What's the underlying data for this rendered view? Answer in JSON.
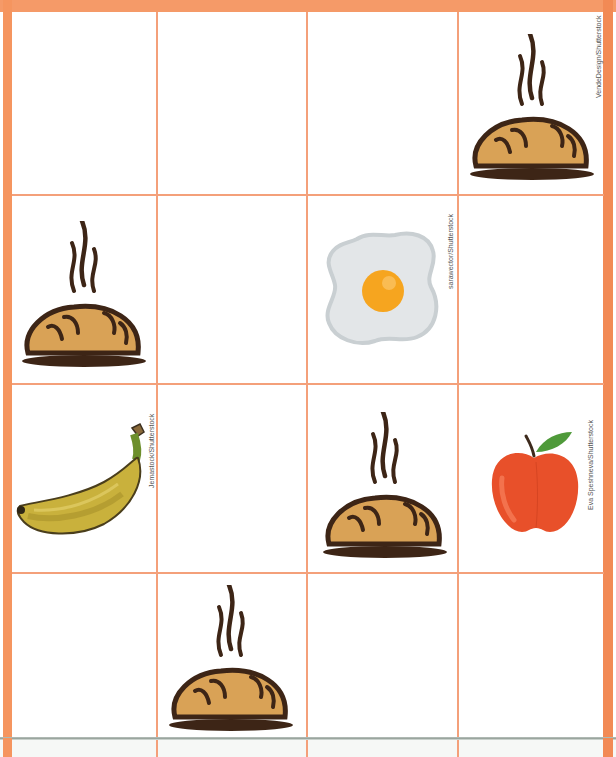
{
  "worksheet": {
    "grid": {
      "rows": 4,
      "cols": 4
    },
    "colors": {
      "border": "#f5955f",
      "grid_line": "#f4a07a",
      "bread_crust": "#d9a256",
      "bread_outline": "#3d2516",
      "egg_white": "#e3e6e8",
      "egg_yolk": "#f6a51f",
      "banana": "#c9b13c",
      "apple": "#e8502a",
      "leaf": "#4f9a3a"
    },
    "cells": [
      {
        "row": 1,
        "col": 1,
        "item": ""
      },
      {
        "row": 1,
        "col": 2,
        "item": ""
      },
      {
        "row": 1,
        "col": 3,
        "item": ""
      },
      {
        "row": 1,
        "col": 4,
        "item": "bread"
      },
      {
        "row": 2,
        "col": 1,
        "item": "bread"
      },
      {
        "row": 2,
        "col": 2,
        "item": ""
      },
      {
        "row": 2,
        "col": 3,
        "item": "fried-egg"
      },
      {
        "row": 2,
        "col": 4,
        "item": ""
      },
      {
        "row": 3,
        "col": 1,
        "item": "banana"
      },
      {
        "row": 3,
        "col": 2,
        "item": ""
      },
      {
        "row": 3,
        "col": 3,
        "item": "bread"
      },
      {
        "row": 3,
        "col": 4,
        "item": "apple"
      },
      {
        "row": 4,
        "col": 1,
        "item": ""
      },
      {
        "row": 4,
        "col": 2,
        "item": "bread"
      },
      {
        "row": 4,
        "col": 3,
        "item": ""
      },
      {
        "row": 4,
        "col": 4,
        "item": ""
      }
    ],
    "credits": {
      "bread": "VendeDesign/Shutterstock",
      "egg": "sarawector/Shutterstock",
      "banana": "Jemastock/Shutterstock",
      "apple": "Eva Speshneva/Shutterstock"
    }
  }
}
